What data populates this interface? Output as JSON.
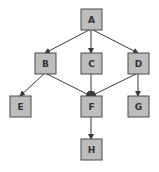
{
  "diagram": {
    "type": "directed-graph",
    "colors": {
      "node_fill": "#bdbdbd",
      "node_stroke": "#4a4a4a",
      "edge": "#3a3a3a",
      "label": "#333333",
      "background": "#ffffff"
    },
    "nodes": [
      {
        "id": "A",
        "label": "A",
        "cx": 91,
        "cy": 19
      },
      {
        "id": "B",
        "label": "B",
        "cx": 45,
        "cy": 63
      },
      {
        "id": "C",
        "label": "C",
        "cx": 91,
        "cy": 63
      },
      {
        "id": "D",
        "label": "D",
        "cx": 138,
        "cy": 63
      },
      {
        "id": "E",
        "label": "E",
        "cx": 20,
        "cy": 106
      },
      {
        "id": "F",
        "label": "F",
        "cx": 91,
        "cy": 106
      },
      {
        "id": "G",
        "label": "G",
        "cx": 138,
        "cy": 106
      },
      {
        "id": "H",
        "label": "H",
        "cx": 91,
        "cy": 149
      }
    ],
    "edges": [
      {
        "from": "A",
        "to": "B"
      },
      {
        "from": "A",
        "to": "C"
      },
      {
        "from": "A",
        "to": "D"
      },
      {
        "from": "B",
        "to": "E"
      },
      {
        "from": "B",
        "to": "F"
      },
      {
        "from": "C",
        "to": "F"
      },
      {
        "from": "D",
        "to": "F"
      },
      {
        "from": "D",
        "to": "G"
      },
      {
        "from": "F",
        "to": "H"
      }
    ]
  }
}
